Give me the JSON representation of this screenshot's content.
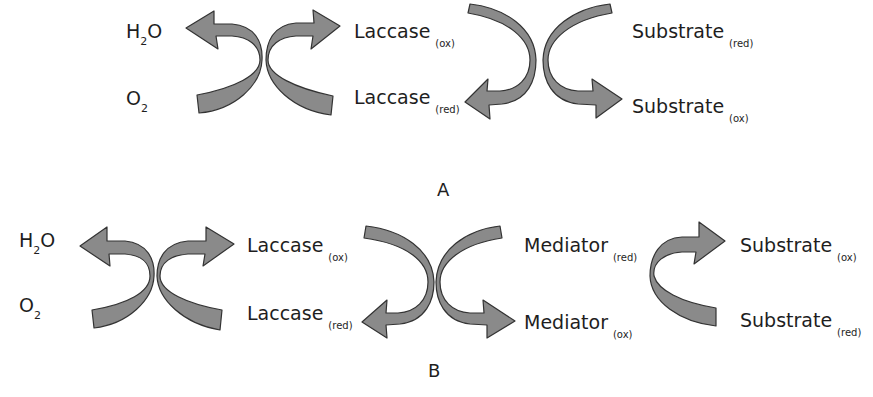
{
  "diagram": {
    "arrow_fill": "#8a8a8a",
    "arrow_stroke": "#333333",
    "panel_a": {
      "label": "A",
      "nodes": {
        "water": {
          "prefix": "H",
          "sub": "2",
          "suffix": "O"
        },
        "oxygen": {
          "prefix": "O",
          "sub": "2",
          "suffix": ""
        },
        "laccase_ox": {
          "name": "Laccase",
          "state": "(ox)"
        },
        "laccase_red": {
          "name": "Laccase",
          "state": "(red)"
        },
        "substrate_red": {
          "name": "Substrate",
          "state": "(red)"
        },
        "substrate_ox": {
          "name": "Substrate",
          "state": "(ox)"
        }
      }
    },
    "panel_b": {
      "label": "B",
      "nodes": {
        "water": {
          "prefix": "H",
          "sub": "2",
          "suffix": "O"
        },
        "oxygen": {
          "prefix": "O",
          "sub": "2",
          "suffix": ""
        },
        "laccase_ox": {
          "name": "Laccase",
          "state": "(ox)"
        },
        "laccase_red": {
          "name": "Laccase",
          "state": "(red)"
        },
        "mediator_red": {
          "name": "Mediator",
          "state": "(red)"
        },
        "mediator_ox": {
          "name": "Mediator",
          "state": "(ox)"
        },
        "substrate_ox": {
          "name": "Substrate",
          "state": "(ox)"
        },
        "substrate_red": {
          "name": "Substrate",
          "state": "(red)"
        }
      }
    }
  }
}
